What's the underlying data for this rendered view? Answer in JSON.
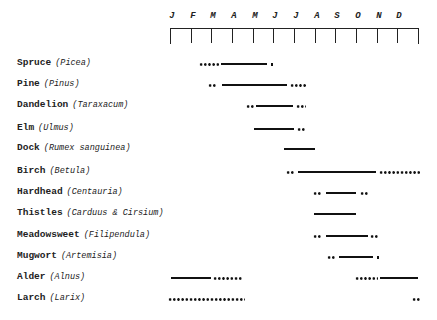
{
  "chart_data": {
    "type": "gantt",
    "title": "",
    "xlabel": "",
    "ylabel": "",
    "axis": {
      "months": [
        "J",
        "F",
        "M",
        "A",
        "M",
        "J",
        "J",
        "A",
        "S",
        "O",
        "N",
        "D"
      ],
      "x_start_px": 170,
      "x_end_px": 418
    },
    "legend": {
      "solid_line": "main flowering/pollen period",
      "dotted_line": "occasional/extended period"
    },
    "series": [
      {
        "common": "Spruce",
        "latin": "(Picea)",
        "y": 64,
        "segments": [
          {
            "type": "dots",
            "x1": 199,
            "x2": 219
          },
          {
            "type": "line",
            "x1": 221,
            "x2": 267
          },
          {
            "type": "dots",
            "x1": 270,
            "x2": 274
          }
        ]
      },
      {
        "common": "Pine",
        "latin": "(Pinus)",
        "y": 85,
        "segments": [
          {
            "type": "dots",
            "x1": 208,
            "x2": 217
          },
          {
            "type": "line",
            "x1": 222,
            "x2": 287
          },
          {
            "type": "dots",
            "x1": 290,
            "x2": 306
          }
        ]
      },
      {
        "common": "Dandelion",
        "latin": "(Taraxacum)",
        "y": 106,
        "segments": [
          {
            "type": "dots",
            "x1": 246,
            "x2": 254
          },
          {
            "type": "line",
            "x1": 256,
            "x2": 293
          },
          {
            "type": "dots",
            "x1": 296,
            "x2": 306
          }
        ]
      },
      {
        "common": "Elm",
        "latin": "(Ulmus)",
        "y": 129,
        "segments": [
          {
            "type": "line",
            "x1": 254,
            "x2": 294
          },
          {
            "type": "dots",
            "x1": 297,
            "x2": 306
          }
        ]
      },
      {
        "common": "Dock",
        "latin": "(Rumex sanguinea)",
        "y": 149,
        "segments": [
          {
            "type": "line",
            "x1": 284,
            "x2": 315
          }
        ]
      },
      {
        "common": "Birch",
        "latin": "(Betula)",
        "y": 172,
        "segments": [
          {
            "type": "dots",
            "x1": 286,
            "x2": 295
          },
          {
            "type": "line",
            "x1": 298,
            "x2": 376
          },
          {
            "type": "dots",
            "x1": 379,
            "x2": 421
          }
        ]
      },
      {
        "common": "Hardhead",
        "latin": "(Centauria)",
        "y": 193,
        "segments": [
          {
            "type": "dots",
            "x1": 313,
            "x2": 322
          },
          {
            "type": "line",
            "x1": 326,
            "x2": 356
          },
          {
            "type": "dots",
            "x1": 360,
            "x2": 368
          }
        ]
      },
      {
        "common": "Thistles",
        "latin": "(Carduus & Cirsium)",
        "y": 214,
        "segments": [
          {
            "type": "line",
            "x1": 314,
            "x2": 356
          }
        ]
      },
      {
        "common": "Meadowsweet",
        "latin": "(Filipendula)",
        "y": 236,
        "segments": [
          {
            "type": "dots",
            "x1": 313,
            "x2": 322
          },
          {
            "type": "line",
            "x1": 326,
            "x2": 368
          },
          {
            "type": "dots",
            "x1": 370,
            "x2": 378
          }
        ]
      },
      {
        "common": "Mugwort",
        "latin": "(Artemisia)",
        "y": 257,
        "segments": [
          {
            "type": "dots",
            "x1": 327,
            "x2": 336
          },
          {
            "type": "line",
            "x1": 339,
            "x2": 373
          },
          {
            "type": "dots",
            "x1": 376,
            "x2": 379
          }
        ]
      },
      {
        "common": "Alder",
        "latin": "(Alnus)",
        "y": 278,
        "segments": [
          {
            "type": "line",
            "x1": 171,
            "x2": 211
          },
          {
            "type": "dots",
            "x1": 213,
            "x2": 243
          },
          {
            "type": "dots",
            "x1": 355,
            "x2": 378
          },
          {
            "type": "line",
            "x1": 380,
            "x2": 418
          }
        ]
      },
      {
        "common": "Larch",
        "latin": "(Larix)",
        "y": 299,
        "segments": [
          {
            "type": "dots",
            "x1": 168,
            "x2": 245
          },
          {
            "type": "dots",
            "x1": 412,
            "x2": 420
          }
        ]
      }
    ]
  }
}
